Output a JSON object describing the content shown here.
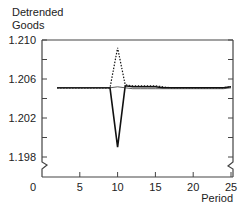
{
  "chart_data": {
    "type": "line",
    "title": "",
    "ylabel": "Detrended Goods",
    "ylabel_lines": [
      "Detrended",
      "Goods"
    ],
    "xlabel": "Period",
    "xlim": [
      0,
      25
    ],
    "ylim": [
      1.198,
      1.21
    ],
    "x_ticks": [
      0,
      5,
      10,
      15,
      20,
      25
    ],
    "x_tick_labels": [
      "0",
      "5",
      "10",
      "15",
      "20",
      "25"
    ],
    "y_ticks": [
      1.198,
      1.2,
      1.202,
      1.204,
      1.206,
      1.208,
      1.21
    ],
    "y_tick_labels": [
      "1.198",
      "",
      "1.202",
      "",
      "1.206",
      "",
      "1.210"
    ],
    "axis_break": true,
    "grid": false,
    "legend": null,
    "x": [
      2,
      3,
      4,
      5,
      6,
      7,
      8,
      9,
      10,
      11,
      12,
      13,
      14,
      15,
      16,
      17,
      18,
      19,
      20,
      21,
      22,
      23,
      24,
      25
    ],
    "series": [
      {
        "name": "solid",
        "style": "solid",
        "values": [
          1.2051,
          1.2051,
          1.2051,
          1.2051,
          1.2051,
          1.2051,
          1.2051,
          1.2051,
          1.199,
          1.2053,
          1.2052,
          1.2052,
          1.2052,
          1.2052,
          1.2051,
          1.2051,
          1.2051,
          1.2051,
          1.2051,
          1.2051,
          1.2051,
          1.2051,
          1.2051,
          1.2052
        ]
      },
      {
        "name": "dotted",
        "style": "dotted",
        "values": [
          1.2051,
          1.2051,
          1.2051,
          1.2051,
          1.2051,
          1.2051,
          1.2051,
          1.2051,
          1.2092,
          1.2054,
          1.2053,
          1.2053,
          1.2053,
          1.2053,
          1.2052,
          1.2051,
          1.2051,
          1.2051,
          1.2051,
          1.2051,
          1.2051,
          1.2051,
          1.2051,
          1.2052
        ]
      },
      {
        "name": "thin",
        "style": "thin-solid",
        "values": [
          1.2051,
          1.2051,
          1.2051,
          1.2051,
          1.2051,
          1.2051,
          1.2051,
          1.2051,
          1.2052,
          1.2051,
          1.205,
          1.205,
          1.205,
          1.205,
          1.205,
          1.205,
          1.205,
          1.205,
          1.205,
          1.205,
          1.205,
          1.205,
          1.205,
          1.2051
        ]
      }
    ]
  }
}
